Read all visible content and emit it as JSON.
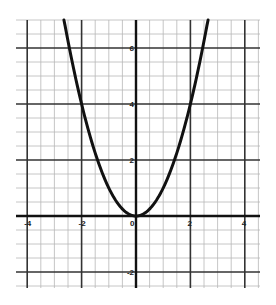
{
  "chart_data": {
    "type": "line",
    "title": "",
    "xlabel": "",
    "ylabel": "",
    "function": "y = x^2",
    "xlim": [
      -4.5,
      4.5
    ],
    "ylim": [
      -2.7,
      7.0
    ],
    "grid": true,
    "minor_grid_step": 0.5,
    "major_grid_step": 2,
    "legend": null,
    "x_tick_labels": [
      {
        "value": -4,
        "label": "-4"
      },
      {
        "value": -2,
        "label": "-2"
      },
      {
        "value": 0,
        "label": "0"
      },
      {
        "value": 2,
        "label": "2"
      },
      {
        "value": 4,
        "label": "4"
      }
    ],
    "y_tick_labels": [
      {
        "value": 6,
        "label": "6"
      },
      {
        "value": 4,
        "label": "4"
      },
      {
        "value": 2,
        "label": "2"
      },
      {
        "value": -2,
        "label": "-2"
      }
    ],
    "series": [
      {
        "name": "y = x^2",
        "x": [
          -2.65,
          -2.5,
          -2,
          -1.5,
          -1,
          -0.5,
          0,
          0.5,
          1,
          1.5,
          2,
          2.5,
          2.65
        ],
        "y": [
          7.02,
          6.25,
          4,
          2.25,
          1,
          0.25,
          0,
          0.25,
          1,
          2.25,
          4,
          6.25,
          7.02
        ]
      }
    ]
  },
  "colors": {
    "background": "#ffffff",
    "minor_grid": "#b8b8b8",
    "major_grid": "#333333",
    "axis": "#111111",
    "curve": "#111111",
    "labels": "#222222"
  }
}
